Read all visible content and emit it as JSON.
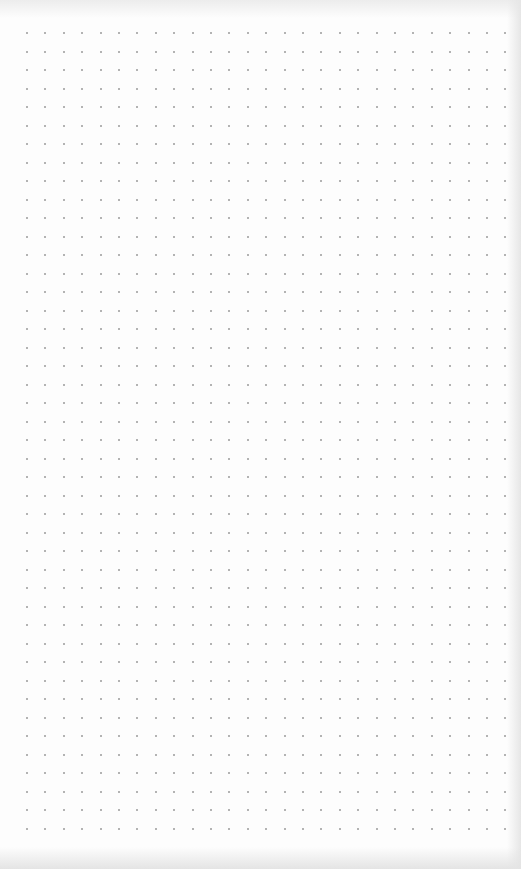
{
  "page": {
    "type": "dot-grid-paper",
    "background_color": "#fdfdfd",
    "dot_color": "#9a9a9a"
  },
  "grid": {
    "columns": 27,
    "rows": 44,
    "origin_x": 27,
    "origin_y": 33,
    "spacing_x": 18.4,
    "spacing_y": 18.5,
    "dot_size": 2
  }
}
